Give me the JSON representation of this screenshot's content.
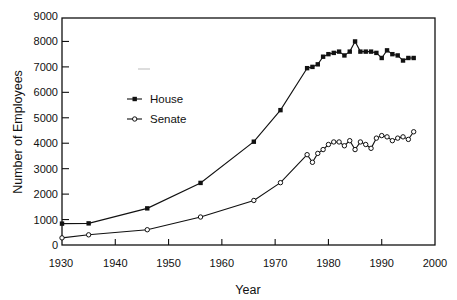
{
  "chart_data": {
    "type": "line",
    "title": "",
    "xlabel": "Year",
    "ylabel": "Number of Employees",
    "xlim": [
      1930,
      2000
    ],
    "ylim": [
      0,
      9000
    ],
    "x_ticks": [
      1930,
      1940,
      1950,
      1960,
      1970,
      1980,
      1990,
      2000
    ],
    "y_ticks": [
      0,
      1000,
      2000,
      3000,
      4000,
      5000,
      6000,
      7000,
      8000,
      9000
    ],
    "grid": false,
    "legend_position": "upper-left inside plot",
    "series": [
      {
        "name": "House",
        "marker": "filled-square",
        "x": [
          1930,
          1935,
          1946,
          1956,
          1966,
          1971,
          1976,
          1977,
          1978,
          1979,
          1980,
          1981,
          1982,
          1983,
          1984,
          1985,
          1986,
          1987,
          1988,
          1989,
          1990,
          1991,
          1992,
          1993,
          1994,
          1995,
          1996
        ],
        "values": [
          840,
          850,
          1440,
          2440,
          4060,
          5300,
          6950,
          7000,
          7100,
          7400,
          7500,
          7550,
          7600,
          7450,
          7600,
          8000,
          7600,
          7600,
          7600,
          7550,
          7350,
          7650,
          7500,
          7450,
          7250,
          7350,
          7350
        ]
      },
      {
        "name": "Senate",
        "marker": "open-circle",
        "x": [
          1930,
          1935,
          1946,
          1956,
          1966,
          1971,
          1976,
          1977,
          1978,
          1979,
          1980,
          1981,
          1982,
          1983,
          1984,
          1985,
          1986,
          1987,
          1988,
          1989,
          1990,
          1991,
          1992,
          1993,
          1994,
          1995,
          1996
        ],
        "values": [
          280,
          400,
          600,
          1100,
          1750,
          2450,
          3550,
          3250,
          3600,
          3750,
          3950,
          4050,
          4050,
          3900,
          4100,
          3750,
          4050,
          3950,
          3800,
          4200,
          4300,
          4250,
          4100,
          4200,
          4250,
          4150,
          4450
        ]
      }
    ]
  },
  "labels": {
    "xlabel": "Year",
    "ylabel": "Number of Employees",
    "legend": [
      "House",
      "Senate"
    ]
  },
  "colors": {
    "line": "#111111",
    "background": "#ffffff"
  }
}
